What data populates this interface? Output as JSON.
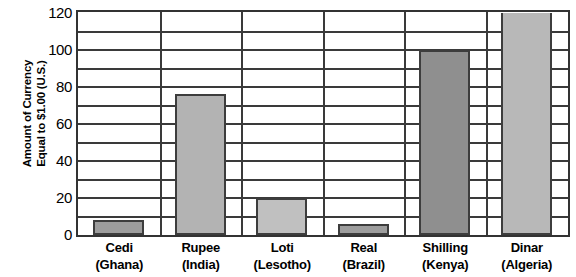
{
  "chart_data": {
    "type": "bar",
    "title": "",
    "xlabel": "",
    "ylabel": "Amount of Currency\nEqual to $1.00 (U.S.)",
    "ylim": [
      0,
      120
    ],
    "ytick_step": 20,
    "gridline_step": 10,
    "grid": true,
    "legend": "none",
    "categories": [
      "Cedi\n(Ghana)",
      "Rupee\n(India)",
      "Loti\n(Lesotho)",
      "Real\n(Brazil)",
      "Shilling\n(Kenya)",
      "Dinar\n(Algeria)"
    ],
    "category_names": [
      "Cedi",
      "Rupee",
      "Loti",
      "Real",
      "Shilling",
      "Dinar"
    ],
    "category_countries": [
      "(Ghana)",
      "(India)",
      "(Lesotho)",
      "(Brazil)",
      "(Kenya)",
      "(Algeria)"
    ],
    "values": [
      8,
      76,
      20,
      6,
      100,
      120
    ],
    "bar_colors": [
      "#9d9d9d",
      "#b3b3b3",
      "#c0c0c0",
      "#9d9d9d",
      "#8f8f8f",
      "#b8b8b8"
    ],
    "ytick_labels": [
      "120",
      "100",
      "80",
      "60",
      "40",
      "20",
      "0"
    ],
    "ytick_values": [
      120,
      100,
      80,
      60,
      40,
      20,
      0
    ],
    "gridline_values": [
      110,
      100,
      90,
      80,
      70,
      60,
      50,
      40,
      30,
      20,
      10
    ],
    "axis_color": "#333333",
    "bar_border_color": "#3d3d3d",
    "background": "#ffffff"
  }
}
